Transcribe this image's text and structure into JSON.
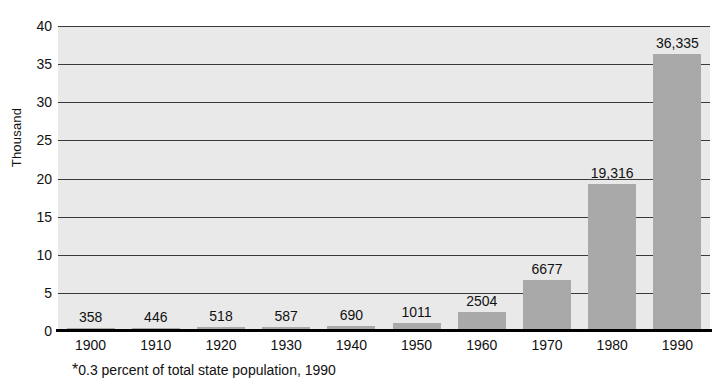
{
  "chart_data": {
    "type": "bar",
    "title": "",
    "subtitle": "",
    "xlabel": "",
    "ylabel": "Thousand",
    "categories": [
      "1900",
      "1910",
      "1920",
      "1930",
      "1940",
      "1950",
      "1960",
      "1970",
      "1980",
      "1990"
    ],
    "values": [
      358,
      446,
      518,
      587,
      690,
      1011,
      2504,
      6677,
      19316,
      36335
    ],
    "value_labels": [
      "358",
      "446",
      "518",
      "587",
      "690",
      "1011",
      "2504",
      "6677",
      "19,316",
      "36,335"
    ],
    "value_unit": "persons",
    "ylim": [
      0,
      40
    ],
    "y_ticks": [
      0,
      5,
      10,
      15,
      20,
      25,
      30,
      35,
      40
    ],
    "y_tick_labels": [
      "0",
      "5",
      "10",
      "15",
      "20",
      "25",
      "30",
      "35",
      "40"
    ],
    "y_tick_scale": "thousands",
    "grid": true,
    "grid_axis": "y",
    "legend": "none",
    "bar_color": "#a9a9a9",
    "plot_background": "#e9e9e9",
    "gridline_color": "#3a3a3a",
    "axis_color": "#000000",
    "footnote": {
      "marker": "*",
      "text": "0.3 percent of total state population, 1990"
    }
  }
}
